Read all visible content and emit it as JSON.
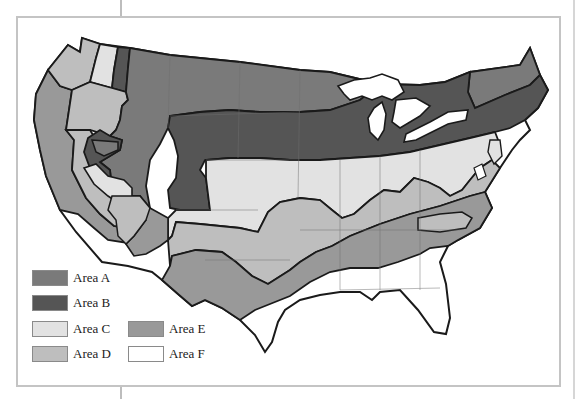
{
  "header": {
    "cut_off_text": "· gr· · y · g"
  },
  "map": {
    "title": "",
    "region": "Contiguous United States",
    "great_lakes_color": "#ffffff",
    "border_color": "#1a1a1a",
    "state_line_color": "#6e6e6e"
  },
  "legend": {
    "items": [
      {
        "key": "A",
        "label": "Area A",
        "color": "#7a7a7a"
      },
      {
        "key": "B",
        "label": "Area B",
        "color": "#555555"
      },
      {
        "key": "C",
        "label": "Area C",
        "color": "#e2e2e2"
      },
      {
        "key": "D",
        "label": "Area D",
        "color": "#bebebe"
      },
      {
        "key": "E",
        "label": "Area E",
        "color": "#999999"
      },
      {
        "key": "F",
        "label": "Area F",
        "color": "#ffffff"
      }
    ]
  }
}
